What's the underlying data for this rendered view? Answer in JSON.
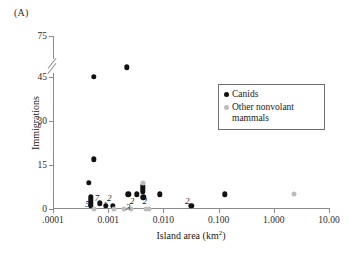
{
  "panel": {
    "label": "(A)"
  },
  "chart_data": {
    "type": "scatter",
    "title": "",
    "xlabel": "Island area (km",
    "xlabel_sup": "2",
    "xlabel_tail": ")",
    "ylabel": "Immigrations",
    "x_scale": "log",
    "x_tick_labels": [
      ".0001",
      "0.001",
      "0.010",
      "0.100",
      "1.000",
      "10.00"
    ],
    "x_tick_values": [
      0.0001,
      0.001,
      0.01,
      0.1,
      1.0,
      10.0
    ],
    "xlim": [
      0.0001,
      10.0
    ],
    "y_tick_labels": [
      "0",
      "15",
      "30",
      "45",
      "75"
    ],
    "y_tick_values": [
      0,
      15,
      30,
      45,
      75
    ],
    "ylim": [
      0,
      75
    ],
    "y_axis_break": {
      "present": true,
      "between": [
        45,
        75
      ]
    },
    "grid": false,
    "legend_position": "inside-right",
    "series": [
      {
        "name": "Canids",
        "color": "#111111",
        "points": [
          {
            "x": 0.0022,
            "y": 52
          },
          {
            "x": 0.00055,
            "y": 45
          },
          {
            "x": 0.00055,
            "y": 17
          },
          {
            "x": 0.00045,
            "y": 9
          },
          {
            "x": 0.0042,
            "y": 8
          },
          {
            "x": 0.0042,
            "y": 7
          },
          {
            "x": 0.0042,
            "y": 6
          },
          {
            "x": 0.0085,
            "y": 5
          },
          {
            "x": 0.13,
            "y": 5
          },
          {
            "x": 0.0023,
            "y": 5
          },
          {
            "x": 0.0033,
            "y": 5
          },
          {
            "x": 0.00048,
            "y": 4
          },
          {
            "x": 0.00048,
            "y": 3
          },
          {
            "x": 0.00048,
            "y": 2
          },
          {
            "x": 0.00048,
            "y": 1
          },
          {
            "x": 0.0007,
            "y": 2
          },
          {
            "x": 0.0009,
            "y": 1
          },
          {
            "x": 0.0012,
            "y": 1
          },
          {
            "x": 0.032,
            "y": 1
          },
          {
            "x": 0.0043,
            "y": 4
          }
        ]
      },
      {
        "name": "Other nonvolant mammals",
        "color": "#bdbdbd",
        "points": [
          {
            "x": 0.0042,
            "y": 9
          },
          {
            "x": 2.3,
            "y": 5
          },
          {
            "x": 0.00055,
            "y": 0
          },
          {
            "x": 0.0013,
            "y": 0
          },
          {
            "x": 0.0019,
            "y": 0
          },
          {
            "x": 0.0026,
            "y": 0
          },
          {
            "x": 0.0048,
            "y": 0
          },
          {
            "x": 0.0055,
            "y": 0
          }
        ]
      }
    ],
    "count_annotations": [
      {
        "label": "5",
        "x": 0.00042,
        "y": 1.6
      },
      {
        "label": "7",
        "x": 0.00063,
        "y": 3.6
      },
      {
        "label": "1",
        "x": 0.00088,
        "y": 1.3
      },
      {
        "label": "2",
        "x": 0.00105,
        "y": 3.8
      },
      {
        "label": "3",
        "x": 0.0023,
        "y": 0.6
      },
      {
        "label": "2",
        "x": 0.0027,
        "y": 2.6
      },
      {
        "label": "2",
        "x": 0.0046,
        "y": 2.6
      },
      {
        "label": "2",
        "x": 0.027,
        "y": 2.6
      }
    ]
  },
  "legend": {
    "items": [
      {
        "label": "Canids"
      },
      {
        "label": "Other nonvolant mammals"
      }
    ]
  }
}
